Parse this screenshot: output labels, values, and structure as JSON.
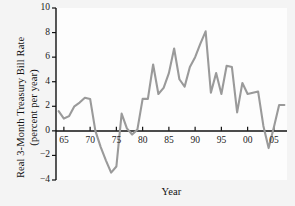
{
  "figure": {
    "background_color": "#f4f4f4",
    "plot_background_color": "#fdfdfd",
    "axis_color": "#111111",
    "line_color": "#9a9a9a"
  },
  "axis_labels": {
    "y_line1": "Real 3-Month Treasury Bill Rate",
    "y_line2": "(percent per year)",
    "x": "Year"
  },
  "chart_data": {
    "type": "line",
    "title": "",
    "subtitle": "",
    "xlabel": "Year",
    "ylabel": "Real 3-Month Treasury Bill Rate (percent per year)",
    "xlim": [
      1963.5,
      2007.5
    ],
    "ylim": [
      -4,
      10
    ],
    "grid": false,
    "legend": null,
    "y_ticks": [
      10,
      8,
      6,
      4,
      2,
      0,
      -2,
      -4
    ],
    "y_tick_labels": [
      "10",
      "8",
      "6",
      "4",
      "2",
      "0",
      "−2",
      "−4"
    ],
    "x_ticks": [
      1965,
      1970,
      1975,
      1980,
      1985,
      1990,
      1995,
      2000,
      2005
    ],
    "x_tick_labels": [
      "65",
      "70",
      "75",
      "80",
      "85",
      "90",
      "95",
      "00",
      "05"
    ],
    "zero_line": 0,
    "series": [
      {
        "name": "Real 3-Month Treasury Bill Rate",
        "color": "#9a9a9a",
        "x": [
          1964,
          1965,
          1966,
          1967,
          1968,
          1969,
          1970,
          1971,
          1972,
          1973,
          1974,
          1975,
          1976,
          1977,
          1978,
          1979,
          1980,
          1981,
          1982,
          1983,
          1984,
          1985,
          1986,
          1987,
          1988,
          1989,
          1990,
          1991,
          1992,
          1993,
          1994,
          1995,
          1996,
          1997,
          1998,
          1999,
          2000,
          2001,
          2002,
          2003,
          2004,
          2005,
          2006,
          2007
        ],
        "y": [
          1.6,
          1.0,
          1.2,
          2.0,
          2.3,
          2.7,
          2.6,
          0.0,
          -1.3,
          -2.4,
          -3.4,
          -2.9,
          1.4,
          0.2,
          -0.3,
          0.1,
          2.6,
          2.6,
          5.4,
          3.0,
          3.5,
          4.7,
          6.7,
          4.2,
          3.6,
          5.2,
          6.0,
          7.1,
          8.1,
          3.1,
          4.7,
          3.0,
          5.3,
          5.2,
          1.5,
          3.9,
          3.0,
          3.1,
          3.2,
          0.4,
          -1.4,
          0.3,
          2.1,
          2.1
        ]
      }
    ]
  }
}
